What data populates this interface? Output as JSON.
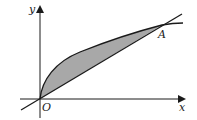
{
  "diagram": {
    "labels": {
      "y_axis": "y",
      "x_axis": "x",
      "origin": "O",
      "point_a": "A"
    },
    "colors": {
      "stroke": "#1a1a1a",
      "shade": "#a8a8a8",
      "background": "#ffffff"
    }
  }
}
